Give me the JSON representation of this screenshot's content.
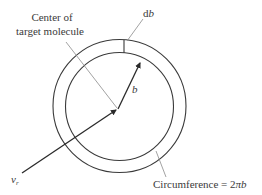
{
  "diagram": {
    "labels": {
      "center_line1": "Center of",
      "center_line2": "target molecule",
      "db_d": "d",
      "db_b": "b",
      "b": "b",
      "vr_v": "v",
      "vr_sub": "r",
      "circumference_prefix": "Circumference = 2",
      "circumference_pi": "π",
      "circumference_b": "b"
    },
    "geometry": {
      "center": [
        119,
        107
      ],
      "outer_radius": 66,
      "inner_radius": 54
    },
    "colors": {
      "stroke": "#3a3a3a",
      "leader": "#8a8a8a",
      "background": "#ffffff"
    }
  }
}
